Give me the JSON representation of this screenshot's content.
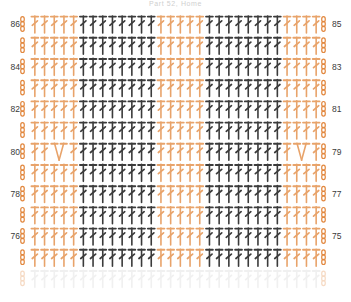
{
  "title": "Part 52, Home",
  "colors": {
    "accent_orange": "#E8A36A",
    "stitch_dark": "#3B3B3B",
    "stitch_light": "#E8A36A",
    "chain_orange": "#E2883F",
    "faded_gray": "#CFCFCF",
    "label_text": "#3A3A3A",
    "background": "#FFFFFF"
  },
  "legend": {
    "stitch_symbol": "double-crochet",
    "chain_symbol": "chain-stitch-oval",
    "decrease_symbol": "two-stitch-decrease"
  },
  "axis": {
    "left_row_numbers": [
      "86",
      "84",
      "82",
      "80",
      "78",
      "76"
    ],
    "right_row_numbers": [
      "85",
      "83",
      "81",
      "79",
      "77",
      "75"
    ]
  },
  "chart_data": {
    "type": "diagram",
    "diagram_kind": "crochet-stitch-chart",
    "columns": 30,
    "rows": 13,
    "row_numbers_left": [
      "86",
      "84",
      "82",
      "80",
      "78",
      "76"
    ],
    "row_numbers_right": [
      "85",
      "83",
      "81",
      "79",
      "77",
      "75"
    ],
    "color_blocks": [
      {
        "name": "left-border",
        "start_col": 0,
        "end_col": 4,
        "color": "#E8A36A"
      },
      {
        "name": "dark-block-1",
        "start_col": 5,
        "end_col": 12,
        "color": "#3B3B3B"
      },
      {
        "name": "orange-block-mid",
        "start_col": 13,
        "end_col": 17,
        "color": "#E8A36A"
      },
      {
        "name": "dark-block-2",
        "start_col": 18,
        "end_col": 25,
        "color": "#3B3B3B"
      },
      {
        "name": "right-border",
        "start_col": 26,
        "end_col": 29,
        "color": "#E8A36A"
      }
    ],
    "decreases": [
      {
        "row_index": 6,
        "col_index": 2,
        "side": "left",
        "type": "two-stitch-decrease"
      },
      {
        "row_index": 6,
        "col_index": 27,
        "side": "right",
        "type": "two-stitch-decrease"
      }
    ]
  },
  "grid": {
    "left_x": 30,
    "right_x": 322,
    "top_y": 16,
    "row_height": 21.2,
    "col_spacing": 9.7
  }
}
